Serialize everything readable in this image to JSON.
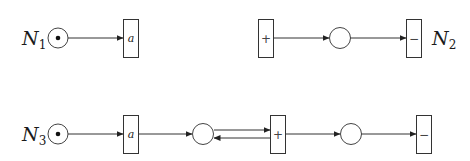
{
  "nets": [
    {
      "name": "N",
      "subscript": "1",
      "label_position": "left",
      "places": [
        {
          "id": "p1",
          "tokens": 1
        }
      ],
      "transitions": [
        {
          "id": "t_a",
          "label": "a"
        }
      ],
      "arcs": [
        {
          "from": "p1",
          "to": "t_a"
        }
      ]
    },
    {
      "name": "N",
      "subscript": "2",
      "label_position": "right",
      "places": [
        {
          "id": "p1",
          "tokens": 0
        }
      ],
      "transitions": [
        {
          "id": "t_plus",
          "label": "+"
        },
        {
          "id": "t_minus",
          "label": "−"
        }
      ],
      "arcs": [
        {
          "from": "t_plus",
          "to": "p1"
        },
        {
          "from": "p1",
          "to": "t_minus"
        }
      ]
    },
    {
      "name": "N",
      "subscript": "3",
      "label_position": "left",
      "places": [
        {
          "id": "p1",
          "tokens": 1
        },
        {
          "id": "p2",
          "tokens": 0
        },
        {
          "id": "p3",
          "tokens": 0
        }
      ],
      "transitions": [
        {
          "id": "t_a",
          "label": "a"
        },
        {
          "id": "t_plus",
          "label": "+"
        },
        {
          "id": "t_minus",
          "label": "−"
        }
      ],
      "arcs": [
        {
          "from": "p1",
          "to": "t_a"
        },
        {
          "from": "t_a",
          "to": "p2"
        },
        {
          "from": "p2",
          "to": "t_plus"
        },
        {
          "from": "t_plus",
          "to": "p2"
        },
        {
          "from": "t_plus",
          "to": "p3"
        },
        {
          "from": "p3",
          "to": "t_minus"
        }
      ]
    }
  ]
}
